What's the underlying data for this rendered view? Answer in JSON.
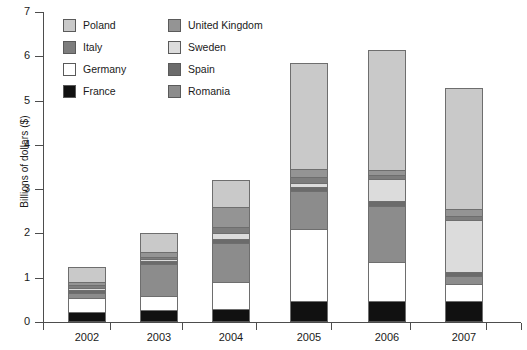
{
  "chart_data": {
    "type": "bar",
    "stacked": true,
    "title": "",
    "xlabel": "",
    "ylabel": "Billions of dollars ($)",
    "categories": [
      "2002",
      "2003",
      "2004",
      "2005",
      "2006",
      "2007"
    ],
    "ylim": [
      0,
      7
    ],
    "yticks": [
      0,
      1,
      2,
      3,
      4,
      5,
      6,
      7
    ],
    "ytick_labels": [
      "0",
      "1",
      "2",
      "3",
      "4",
      "5",
      "6",
      "7"
    ],
    "grid": false,
    "legend_position": "top-left-inside",
    "series": [
      {
        "name": "France",
        "color": "#111111",
        "values": [
          0.22,
          0.28,
          0.3,
          0.47,
          0.48,
          0.48
        ]
      },
      {
        "name": "Germany",
        "color": "#ffffff",
        "values": [
          0.33,
          0.3,
          0.6,
          1.63,
          0.87,
          0.37
        ]
      },
      {
        "name": "Romania",
        "color": "#8c8c8c",
        "values": [
          0.1,
          0.72,
          0.88,
          0.87,
          1.28,
          0.2
        ]
      },
      {
        "name": "Spain",
        "color": "#6b6b6b",
        "values": [
          0.07,
          0.07,
          0.1,
          0.08,
          0.1,
          0.08
        ]
      },
      {
        "name": "Sweden",
        "color": "#dcdcdc",
        "values": [
          0.05,
          0.05,
          0.12,
          0.1,
          0.5,
          1.18
        ]
      },
      {
        "name": "Italy",
        "color": "#7d7d7d",
        "values": [
          0.06,
          0.06,
          0.15,
          0.12,
          0.08,
          0.09
        ]
      },
      {
        "name": "United Kingdom",
        "color": "#949494",
        "values": [
          0.08,
          0.1,
          0.45,
          0.18,
          0.12,
          0.15
        ]
      },
      {
        "name": "Poland",
        "color": "#c9c9c9",
        "values": [
          0.34,
          0.42,
          0.6,
          2.4,
          2.72,
          2.73
        ]
      }
    ],
    "totals": [
      1.25,
      2.0,
      3.2,
      5.85,
      6.15,
      5.28
    ]
  },
  "legend": {
    "items": [
      {
        "label": "Poland",
        "color": "#c9c9c9"
      },
      {
        "label": "Italy",
        "color": "#7d7d7d"
      },
      {
        "label": "Germany",
        "color": "#ffffff"
      },
      {
        "label": "France",
        "color": "#111111"
      },
      {
        "label": "United Kingdom",
        "color": "#949494"
      },
      {
        "label": "Sweden",
        "color": "#dcdcdc"
      },
      {
        "label": "Spain",
        "color": "#6b6b6b"
      },
      {
        "label": "Romania",
        "color": "#8c8c8c"
      }
    ]
  },
  "axis": {
    "y_title": "Billions of dollars ($)"
  }
}
